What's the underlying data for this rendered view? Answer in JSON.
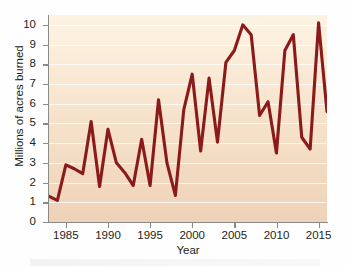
{
  "chart_data": {
    "type": "line",
    "title": "",
    "xlabel": "Year",
    "ylabel": "Millions of acres burned",
    "xlim": [
      1983,
      2016
    ],
    "ylim": [
      0,
      10.5
    ],
    "grid": true,
    "legend": "none",
    "line_color": "#8B1A1A",
    "x_ticks": [
      1985,
      1990,
      1995,
      2000,
      2005,
      2010,
      2015
    ],
    "y_ticks": [
      0,
      1,
      2,
      3,
      4,
      5,
      6,
      7,
      8,
      9,
      10
    ],
    "series": [
      {
        "name": "Acres burned",
        "x": [
          1983,
          1984,
          1985,
          1986,
          1987,
          1988,
          1989,
          1990,
          1991,
          1992,
          1993,
          1994,
          1995,
          1996,
          1997,
          1998,
          1999,
          2000,
          2001,
          2002,
          2003,
          2004,
          2005,
          2006,
          2007,
          2008,
          2009,
          2010,
          2011,
          2012,
          2013,
          2014,
          2015,
          2016
        ],
        "values": [
          1.3,
          1.1,
          2.9,
          2.7,
          2.45,
          5.1,
          1.8,
          4.7,
          3.0,
          2.5,
          1.85,
          4.2,
          1.85,
          6.2,
          3.0,
          1.35,
          5.7,
          7.5,
          3.6,
          7.3,
          4.05,
          8.1,
          8.7,
          10.0,
          9.5,
          5.4,
          6.1,
          3.5,
          8.7,
          9.5,
          4.3,
          3.7,
          10.1,
          5.6
        ]
      }
    ]
  },
  "axes": {
    "y_tick_labels": [
      "10",
      "9",
      "8",
      "7",
      "6",
      "5",
      "4",
      "3",
      "2",
      "1",
      "0"
    ],
    "x_tick_labels": [
      "1985",
      "1990",
      "1995",
      "2000",
      "2005",
      "2010",
      "2015"
    ],
    "y_title": "Millions of acres burned",
    "x_title": "Year"
  }
}
